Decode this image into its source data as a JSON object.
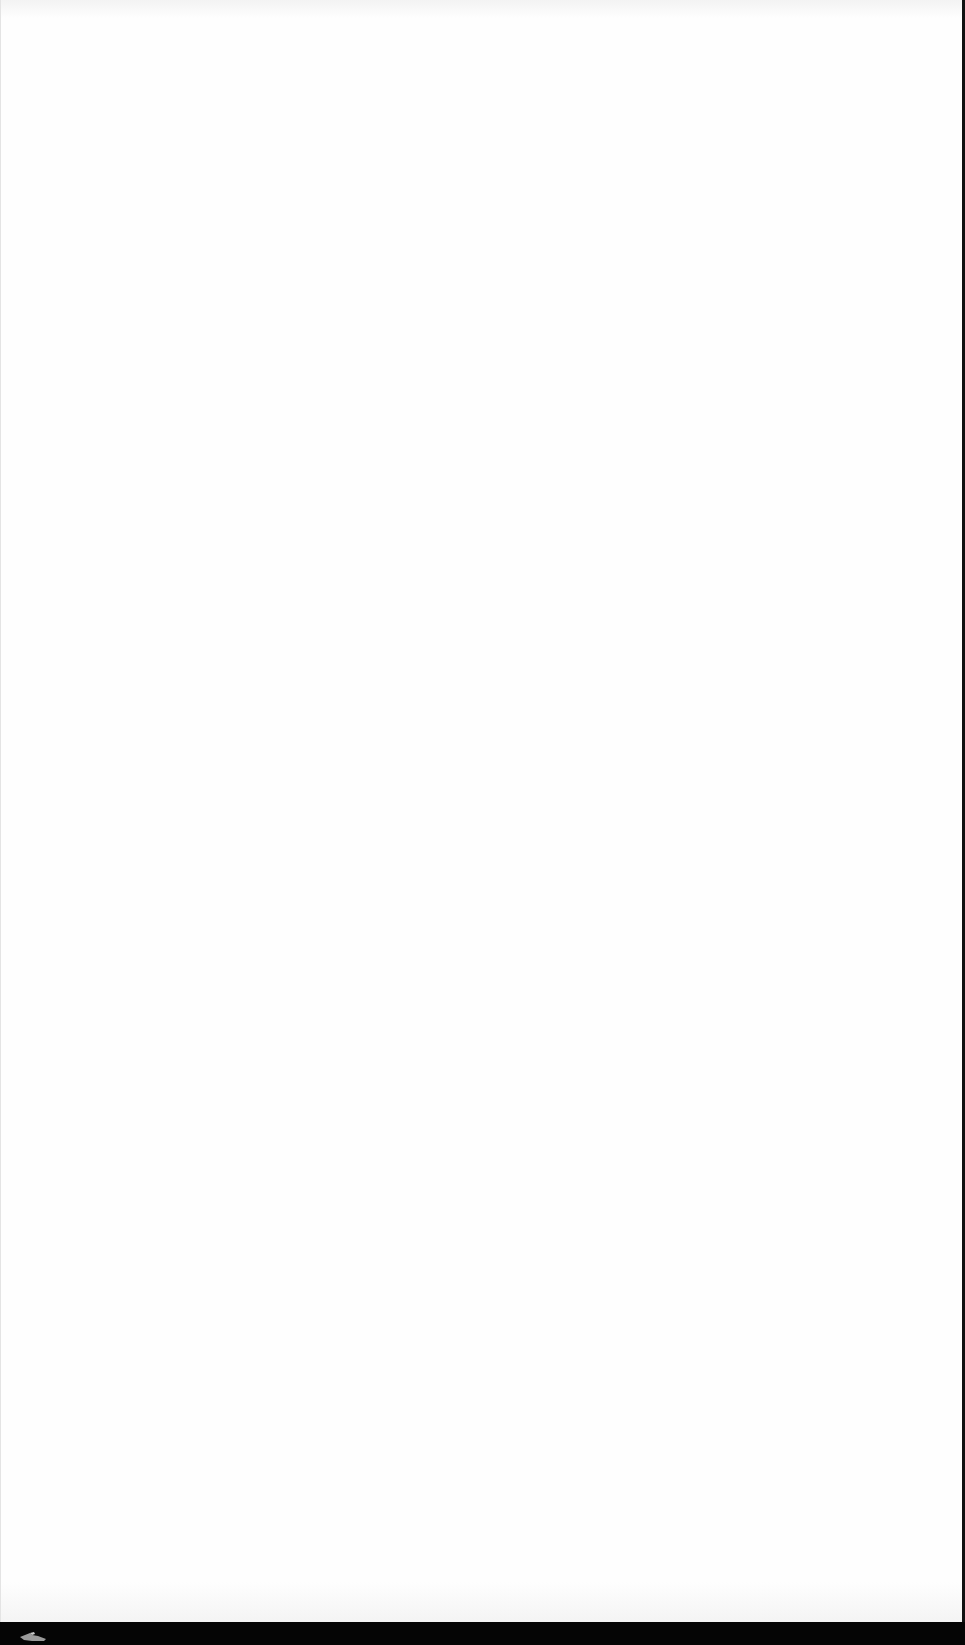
{
  "screen": {
    "background_color": "#fefefe",
    "frame_color": "#050505"
  },
  "page": {
    "content": ""
  },
  "bottom_bar": {
    "icons": [
      {
        "name": "pointer-hand-icon",
        "color": "#9a9a9a"
      }
    ]
  }
}
